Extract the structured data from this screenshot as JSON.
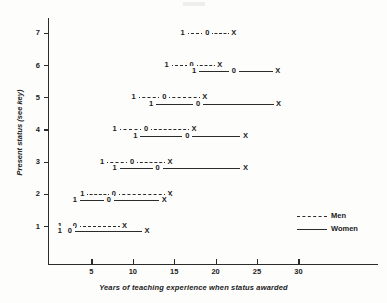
{
  "chart_data": {
    "type": "line",
    "title": "",
    "xlabel": "Years of teaching experience when status awarded",
    "ylabel": "Present status (see key)",
    "xlim": [
      0,
      40
    ],
    "ylim": [
      0,
      7.8
    ],
    "xticks": [
      5,
      10,
      15,
      20,
      25,
      30
    ],
    "yticks": [
      1,
      2,
      3,
      4,
      5,
      6,
      7
    ],
    "grid": false,
    "legend_position": "right-lower",
    "legend": [
      {
        "name": "Men",
        "style": "dashed"
      },
      {
        "name": "Women",
        "style": "solid"
      }
    ],
    "marker_labels": [
      "1",
      "0",
      "X"
    ],
    "series": [
      {
        "name": "Men",
        "style": "dashed",
        "points": [
          {
            "status": 7,
            "values": [
              16.0,
              19.0,
              22.2
            ],
            "labels": [
              "1",
              "0",
              "X"
            ]
          },
          {
            "status": 6,
            "values": [
              14.1,
              17.1,
              20.5
            ],
            "labels": [
              "1",
              "0",
              "X"
            ]
          },
          {
            "status": 5,
            "values": [
              10.1,
              13.8,
              18.7
            ],
            "labels": [
              "1",
              "0",
              "X"
            ]
          },
          {
            "status": 4,
            "values": [
              7.8,
              11.6,
              17.4
            ],
            "labels": [
              "1",
              "0",
              "X"
            ]
          },
          {
            "status": 3,
            "values": [
              6.3,
              9.9,
              14.5
            ],
            "labels": [
              "1",
              "0",
              "X"
            ]
          },
          {
            "status": 2,
            "values": [
              3.9,
              7.7,
              14.5
            ],
            "labels": [
              "1",
              "0",
              "X"
            ]
          },
          {
            "status": 1,
            "values": [
              1.2,
              3.0,
              9.0
            ],
            "labels": [
              "1",
              "0",
              "X"
            ]
          }
        ]
      },
      {
        "name": "Women",
        "style": "solid",
        "points": [
          {
            "status": 5.8,
            "values": [
              17.4,
              22.2,
              27.5
            ],
            "labels": [
              "1",
              "0",
              "X"
            ]
          },
          {
            "status": 4.8,
            "values": [
              12.2,
              17.9,
              27.6
            ],
            "labels": [
              "1",
              "0",
              "X"
            ]
          },
          {
            "status": 3.8,
            "values": [
              10.3,
              16.6,
              23.6
            ],
            "labels": [
              "1",
              "0",
              "X"
            ]
          },
          {
            "status": 2.8,
            "values": [
              7.8,
              13.0,
              23.6
            ],
            "labels": [
              "1",
              "0",
              "X"
            ]
          },
          {
            "status": 1.8,
            "values": [
              3.0,
              7.1,
              13.8
            ],
            "labels": [
              "1",
              "0",
              "X"
            ]
          },
          {
            "status": 0.85,
            "values": [
              1.2,
              2.4,
              11.7
            ],
            "labels": [
              "1",
              "0",
              "X"
            ]
          }
        ]
      }
    ]
  },
  "axes": {
    "y_title": "Present status (see key)",
    "x_title": "Years of teaching experience when status awarded",
    "x_tick_labels": [
      "5",
      "10",
      "15",
      "20",
      "25",
      "30"
    ],
    "y_tick_labels": [
      "1",
      "2",
      "3",
      "4",
      "5",
      "6",
      "7"
    ]
  },
  "legend": {
    "men_label": "Men",
    "women_label": "Women"
  },
  "colors": {
    "ink": "#2b2b2b",
    "paper": "#fdfdfc"
  }
}
